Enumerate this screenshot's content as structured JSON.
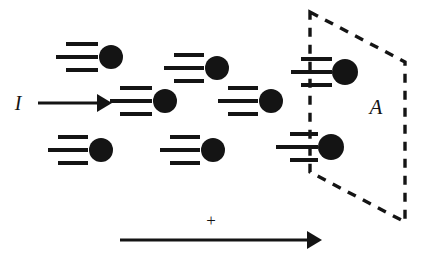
{
  "figure": {
    "background_color": "#ffffff",
    "ink_color": "#141414",
    "width": 424,
    "height": 272
  },
  "labels": {
    "current": "I",
    "area": "A",
    "positive_direction": "+"
  },
  "current_arrow": {
    "name": "current-direction-arrow",
    "x1": 38,
    "y1": 103,
    "x2": 112,
    "y2": 103,
    "stroke_width": 3.2,
    "head_length": 15,
    "head_half_width": 9
  },
  "current_label_position": {
    "x": 18,
    "y": 110,
    "font_size": 20
  },
  "positive_axis_arrow": {
    "name": "positive-direction-arrow",
    "x1": 120,
    "y1": 240,
    "x2": 322,
    "y2": 240,
    "stroke_width": 3.0,
    "head_length": 15,
    "head_half_width": 9
  },
  "plus_label_position": {
    "x": 211,
    "y": 226,
    "font_size": 17
  },
  "area_label_position": {
    "x": 376,
    "y": 114,
    "font_size": 21
  },
  "area_plane": {
    "name": "area-parallelogram",
    "vertices": [
      {
        "x": 310,
        "y": 12
      },
      {
        "x": 405,
        "y": 62
      },
      {
        "x": 405,
        "y": 222
      },
      {
        "x": 310,
        "y": 172
      }
    ],
    "stroke_width": 3.4,
    "dash_pattern": "9 8"
  },
  "particles": [
    {
      "name": "particle-1",
      "cx": 111,
      "cy": 57,
      "r": 12,
      "lines": [
        {
          "x1": 66,
          "x2": 98,
          "y": 44
        },
        {
          "x1": 56,
          "x2": 98,
          "y": 57
        },
        {
          "x1": 66,
          "x2": 98,
          "y": 70
        }
      ]
    },
    {
      "name": "particle-2",
      "cx": 101,
      "cy": 150,
      "r": 12,
      "lines": [
        {
          "x1": 58,
          "x2": 88,
          "y": 137
        },
        {
          "x1": 48,
          "x2": 88,
          "y": 150
        },
        {
          "x1": 58,
          "x2": 88,
          "y": 163
        }
      ]
    },
    {
      "name": "particle-3",
      "cx": 165,
      "cy": 101,
      "r": 12,
      "lines": [
        {
          "x1": 120,
          "x2": 152,
          "y": 88
        },
        {
          "x1": 110,
          "x2": 152,
          "y": 101
        },
        {
          "x1": 120,
          "x2": 152,
          "y": 114
        }
      ]
    },
    {
      "name": "particle-4",
      "cx": 217,
      "cy": 68,
      "r": 12,
      "lines": [
        {
          "x1": 174,
          "x2": 204,
          "y": 55
        },
        {
          "x1": 164,
          "x2": 204,
          "y": 68
        },
        {
          "x1": 174,
          "x2": 204,
          "y": 81
        }
      ]
    },
    {
      "name": "particle-5",
      "cx": 213,
      "cy": 150,
      "r": 12,
      "lines": [
        {
          "x1": 170,
          "x2": 200,
          "y": 137
        },
        {
          "x1": 160,
          "x2": 200,
          "y": 150
        },
        {
          "x1": 170,
          "x2": 200,
          "y": 163
        }
      ]
    },
    {
      "name": "particle-6",
      "cx": 271,
      "cy": 101,
      "r": 12,
      "lines": [
        {
          "x1": 228,
          "x2": 258,
          "y": 88
        },
        {
          "x1": 218,
          "x2": 258,
          "y": 101
        },
        {
          "x1": 228,
          "x2": 258,
          "y": 114
        }
      ]
    },
    {
      "name": "particle-7",
      "cx": 345,
      "cy": 72,
      "r": 13,
      "lines": [
        {
          "x1": 301,
          "x2": 332,
          "y": 59
        },
        {
          "x1": 291,
          "x2": 332,
          "y": 72
        },
        {
          "x1": 301,
          "x2": 332,
          "y": 85
        }
      ]
    },
    {
      "name": "particle-8",
      "cx": 331,
      "cy": 147,
      "r": 13,
      "lines": [
        {
          "x1": 290,
          "x2": 318,
          "y": 134
        },
        {
          "x1": 276,
          "x2": 318,
          "y": 147
        },
        {
          "x1": 290,
          "x2": 318,
          "y": 160
        }
      ]
    }
  ],
  "motion_line_stroke_width": 4.0
}
